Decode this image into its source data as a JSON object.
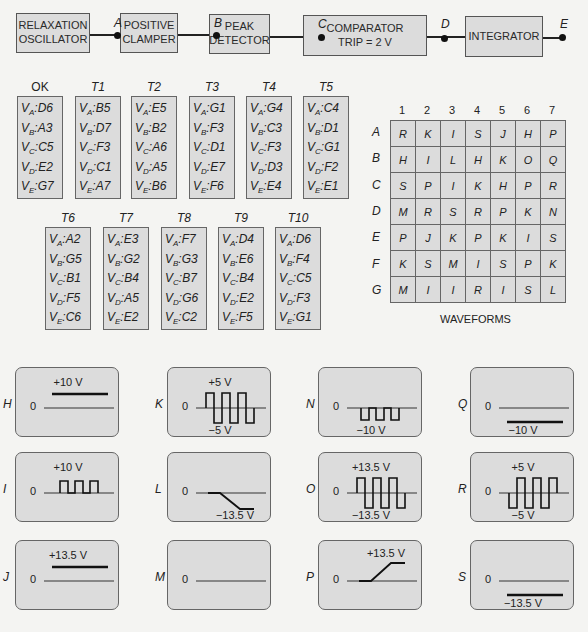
{
  "block_diagram": {
    "blocks": [
      {
        "label": "RELAXATION\nOSCILLATOR"
      },
      {
        "label": "POSITIVE\nCLAMPER"
      },
      {
        "label": "PEAK\nDETECTOR"
      },
      {
        "label": "COMPARATOR\nTRIP  = 2 V"
      },
      {
        "label": "INTEGRATOR"
      }
    ],
    "nodes": [
      "A",
      "B",
      "C",
      "D",
      "E"
    ]
  },
  "tables": [
    {
      "name": "OK",
      "rows": [
        {
          "v": "A",
          "val": "D6"
        },
        {
          "v": "B",
          "val": "A3"
        },
        {
          "v": "C",
          "val": "C5"
        },
        {
          "v": "D",
          "val": "E2"
        },
        {
          "v": "E",
          "val": "G7"
        }
      ]
    },
    {
      "name": "T1",
      "rows": [
        {
          "v": "A",
          "val": "B5"
        },
        {
          "v": "B",
          "val": "D7"
        },
        {
          "v": "C",
          "val": "F3"
        },
        {
          "v": "D",
          "val": "C1"
        },
        {
          "v": "E",
          "val": "A7"
        }
      ]
    },
    {
      "name": "T2",
      "rows": [
        {
          "v": "A",
          "val": "E5"
        },
        {
          "v": "B",
          "val": "B2"
        },
        {
          "v": "C",
          "val": "A6"
        },
        {
          "v": "D",
          "val": "A5"
        },
        {
          "v": "E",
          "val": "B6"
        }
      ]
    },
    {
      "name": "T3",
      "rows": [
        {
          "v": "A",
          "val": "G1"
        },
        {
          "v": "B",
          "val": "F3"
        },
        {
          "v": "C",
          "val": "D1"
        },
        {
          "v": "D",
          "val": "E7"
        },
        {
          "v": "E",
          "val": "F6"
        }
      ]
    },
    {
      "name": "T4",
      "rows": [
        {
          "v": "A",
          "val": "G4"
        },
        {
          "v": "B",
          "val": "C3"
        },
        {
          "v": "C",
          "val": "F3"
        },
        {
          "v": "D",
          "val": "D3"
        },
        {
          "v": "E",
          "val": "E4"
        }
      ]
    },
    {
      "name": "T5",
      "rows": [
        {
          "v": "A",
          "val": "C4"
        },
        {
          "v": "B",
          "val": "D1"
        },
        {
          "v": "C",
          "val": "G1"
        },
        {
          "v": "D",
          "val": "F2"
        },
        {
          "v": "E",
          "val": "E1"
        }
      ]
    },
    {
      "name": "T6",
      "rows": [
        {
          "v": "A",
          "val": "A2"
        },
        {
          "v": "B",
          "val": "G5"
        },
        {
          "v": "C",
          "val": "B1"
        },
        {
          "v": "D",
          "val": "F5"
        },
        {
          "v": "E",
          "val": "C6"
        }
      ]
    },
    {
      "name": "T7",
      "rows": [
        {
          "v": "A",
          "val": "E3"
        },
        {
          "v": "B",
          "val": "G2"
        },
        {
          "v": "C",
          "val": "B4"
        },
        {
          "v": "D",
          "val": "A5"
        },
        {
          "v": "E",
          "val": "E2"
        }
      ]
    },
    {
      "name": "T8",
      "rows": [
        {
          "v": "A",
          "val": "F7"
        },
        {
          "v": "B",
          "val": "G3"
        },
        {
          "v": "C",
          "val": "B7"
        },
        {
          "v": "D",
          "val": "G6"
        },
        {
          "v": "E",
          "val": "C2"
        }
      ]
    },
    {
      "name": "T9",
      "rows": [
        {
          "v": "A",
          "val": "D4"
        },
        {
          "v": "B",
          "val": "E6"
        },
        {
          "v": "C",
          "val": "B4"
        },
        {
          "v": "D",
          "val": "E2"
        },
        {
          "v": "E",
          "val": "F5"
        }
      ]
    },
    {
      "name": "T10",
      "rows": [
        {
          "v": "A",
          "val": "D6"
        },
        {
          "v": "B",
          "val": "F4"
        },
        {
          "v": "C",
          "val": "C5"
        },
        {
          "v": "D",
          "val": "F3"
        },
        {
          "v": "E",
          "val": "G1"
        }
      ]
    }
  ],
  "waveform_grid": {
    "columns": [
      "1",
      "2",
      "3",
      "4",
      "5",
      "6",
      "7"
    ],
    "rows": [
      {
        "label": "A",
        "cells": [
          "R",
          "K",
          "I",
          "S",
          "J",
          "H",
          "P"
        ]
      },
      {
        "label": "B",
        "cells": [
          "H",
          "I",
          "L",
          "H",
          "K",
          "O",
          "Q"
        ]
      },
      {
        "label": "C",
        "cells": [
          "S",
          "P",
          "I",
          "K",
          "H",
          "P",
          "R"
        ]
      },
      {
        "label": "D",
        "cells": [
          "M",
          "R",
          "S",
          "R",
          "P",
          "K",
          "N"
        ]
      },
      {
        "label": "E",
        "cells": [
          "P",
          "J",
          "K",
          "P",
          "K",
          "I",
          "S"
        ]
      },
      {
        "label": "F",
        "cells": [
          "K",
          "S",
          "M",
          "I",
          "S",
          "P",
          "K"
        ]
      },
      {
        "label": "G",
        "cells": [
          "M",
          "I",
          "I",
          "R",
          "I",
          "S",
          "L"
        ]
      }
    ],
    "caption": "WAVEFORMS"
  },
  "waveforms": [
    {
      "id": "H",
      "type": "dc",
      "zero": "0",
      "label_top": "+10 V"
    },
    {
      "id": "K",
      "type": "square_bipolar",
      "zero": "0",
      "label_top": "+5 V",
      "label_bottom": "−5 V"
    },
    {
      "id": "N",
      "type": "pulse_negative",
      "zero": "0",
      "label_bottom": "−10 V"
    },
    {
      "id": "Q",
      "type": "dc_negative",
      "zero": "0",
      "label_bottom": "−10 V"
    },
    {
      "id": "I",
      "type": "pulse_positive",
      "zero": "0",
      "label_top": "+10 V"
    },
    {
      "id": "L",
      "type": "ramp_down",
      "zero": "0",
      "label_bottom": "−13.5 V"
    },
    {
      "id": "O",
      "type": "square_bipolar",
      "zero": "0",
      "label_top": "+13.5 V",
      "label_bottom": "−13.5 V"
    },
    {
      "id": "R",
      "type": "square_bipolar_inv",
      "zero": "0",
      "label_top": "+5 V",
      "label_bottom": "−5 V"
    },
    {
      "id": "J",
      "type": "dc",
      "zero": "0",
      "label_top": "+13.5 V"
    },
    {
      "id": "M",
      "type": "zero",
      "zero": "0"
    },
    {
      "id": "P",
      "type": "ramp_up",
      "zero": "0",
      "label_top": "+13.5 V"
    },
    {
      "id": "S",
      "type": "dc_negative",
      "zero": "0",
      "label_bottom": "−13.5 V"
    }
  ]
}
